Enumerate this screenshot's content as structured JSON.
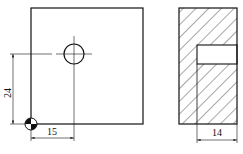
{
  "drawing": {
    "front_view": {
      "label": "front-view"
    },
    "side_view": {
      "label": "section-view"
    },
    "dimensions": {
      "vertical": "24",
      "horizontal_front": "15",
      "horizontal_side": "14"
    }
  }
}
